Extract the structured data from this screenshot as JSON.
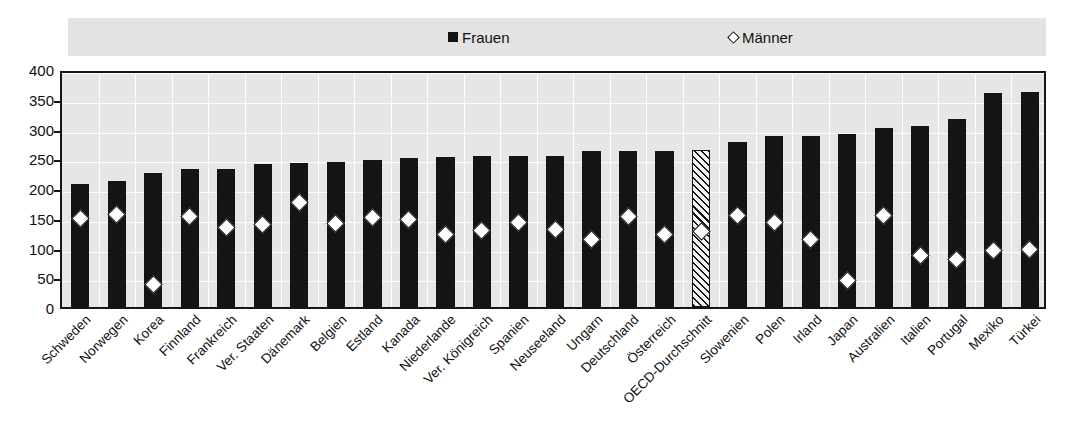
{
  "legend": {
    "frauen": {
      "label": "Frauen",
      "icon": "filled-square-icon",
      "color": "#141414"
    },
    "maenner": {
      "label": "Männer",
      "icon": "open-diamond-icon",
      "color": "#ffffff"
    }
  },
  "axis": {
    "y_ticks": [
      "400",
      "350",
      "300",
      "250",
      "200",
      "150",
      "100",
      "50",
      "0"
    ]
  },
  "chart_data": {
    "type": "bar",
    "title": "",
    "subtitle": "",
    "xlabel": "",
    "ylabel": "",
    "ylim": [
      0,
      400
    ],
    "ytick_step": 50,
    "grid": true,
    "legend_position": "top",
    "categories": [
      "Schweden",
      "Norwegen",
      "Korea",
      "Finnland",
      "Frankreich",
      "Ver. Staaten",
      "Dänemark",
      "Belgien",
      "Estland",
      "Kanada",
      "Niederlande",
      "Ver. Königreich",
      "Spanien",
      "Neuseeland",
      "Ungarn",
      "Deutschland",
      "Österreich",
      "OECD-Durchschnitt",
      "Slowenien",
      "Polen",
      "Irland",
      "Japan",
      "Australien",
      "Italien",
      "Portugal",
      "Mexiko",
      "Türkei"
    ],
    "highlight_category": "OECD-Durchschnitt",
    "series": [
      {
        "name": "Frauen",
        "type": "bar",
        "values": [
          207,
          212,
          226,
          232,
          232,
          241,
          242,
          243,
          247,
          250,
          252,
          253,
          253,
          253,
          262,
          262,
          262,
          264,
          278,
          288,
          288,
          290,
          301,
          305,
          316,
          359,
          362
        ]
      },
      {
        "name": "Männer",
        "type": "scatter",
        "values": [
          156,
          163,
          45,
          159,
          140,
          145,
          183,
          147,
          157,
          154,
          129,
          136,
          148,
          137,
          121,
          158,
          128,
          133,
          160,
          148,
          120,
          52,
          160,
          94,
          86,
          101,
          104
        ]
      }
    ]
  }
}
